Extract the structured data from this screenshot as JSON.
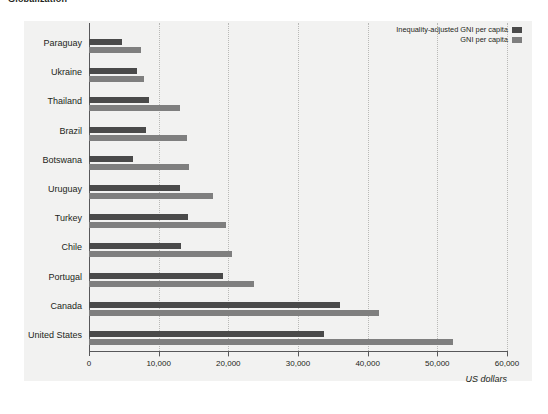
{
  "figure": {
    "clipped_heading": "Globalization"
  },
  "legend": {
    "position": "top-right",
    "entries": [
      {
        "label": "Inequality-adjusted GNI per capita",
        "color": "#4a4a4a",
        "key": "iagni"
      },
      {
        "label": "GNI per capita",
        "color": "#7f7f7f",
        "key": "gni"
      }
    ]
  },
  "axis": {
    "xlabel": "US dollars",
    "ticks": [
      "0",
      "10,000",
      "20,000",
      "30,000",
      "40,000",
      "50,000",
      "60,000"
    ],
    "tick_values": [
      0,
      10000,
      20000,
      30000,
      40000,
      50000,
      60000
    ]
  },
  "chart_data": {
    "type": "bar",
    "orientation": "horizontal",
    "title": "Globalization",
    "xlabel": "US dollars",
    "ylabel": "",
    "xlim": [
      0,
      60000
    ],
    "grid": "vertical-dotted",
    "legend_position": "top-right",
    "categories": [
      "Paraguay",
      "Ukraine",
      "Thailand",
      "Brazil",
      "Botswana",
      "Uruguay",
      "Turkey",
      "Chile",
      "Portugal",
      "Canada",
      "United States"
    ],
    "series": [
      {
        "name": "Inequality-adjusted GNI per capita",
        "color": "#4a4a4a",
        "values": [
          4800,
          6900,
          8600,
          8200,
          6300,
          13000,
          14200,
          13200,
          19200,
          36000,
          33800
        ]
      },
      {
        "name": "GNI per capita",
        "color": "#7f7f7f",
        "values": [
          7500,
          7900,
          13000,
          14000,
          14300,
          17800,
          19700,
          20500,
          23700,
          41600,
          52200
        ]
      }
    ]
  },
  "colors": {
    "panel_background": "#f2f2f1",
    "axis_line": "#58585a",
    "gridline": "#b9b9b7",
    "series_dark": "#4a4a4a",
    "series_light": "#7f7f7f"
  }
}
